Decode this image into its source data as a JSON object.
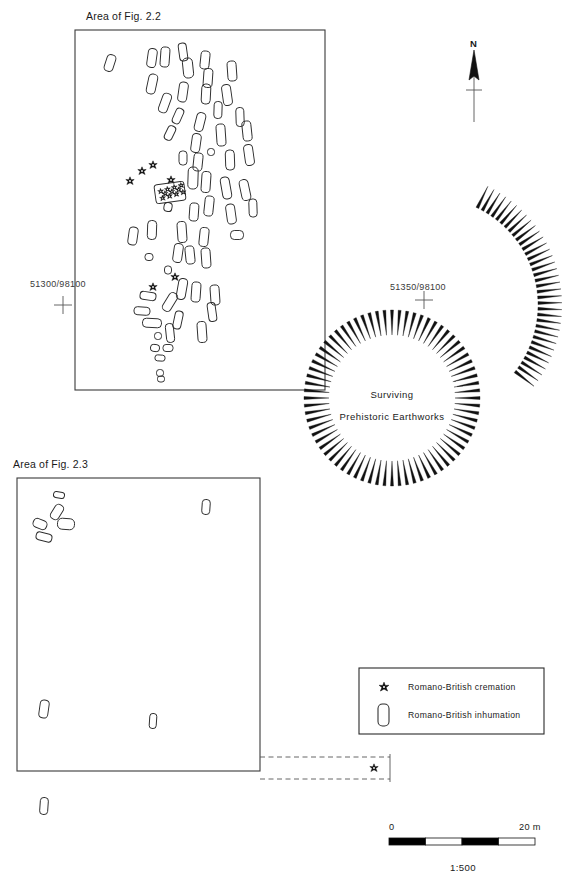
{
  "figure": {
    "type": "archaeological-site-plan",
    "background_color": "#ffffff",
    "ink_color": "#1a1a1a"
  },
  "area_labels": {
    "fig22": "Area of Fig. 2.2",
    "fig23": "Area of Fig. 2.3"
  },
  "grid_coordinates": [
    {
      "label": "51300/98100",
      "x": 63,
      "y": 305
    },
    {
      "label": "51350/98100",
      "x": 424,
      "y": 300
    }
  ],
  "earthworks": {
    "line1": "Surviving",
    "line2": "Prehistoric Earthworks"
  },
  "north_arrow": {
    "label": "N"
  },
  "legend": {
    "items": [
      {
        "symbol": "cremation-star-icon",
        "label": "Romano-British cremation"
      },
      {
        "symbol": "inhumation-grave-icon",
        "label": "Romano-British inhumation"
      }
    ]
  },
  "scale_bar": {
    "start_label": "0",
    "end_label": "20 m",
    "ratio": "1:500",
    "segments": 4,
    "segment_colors": [
      "#000000",
      "#ffffff",
      "#000000",
      "#ffffff"
    ]
  },
  "map_geometry": {
    "area_fig22_box": {
      "x": 75,
      "y": 30,
      "w": 250,
      "h": 360
    },
    "area_fig23_box": {
      "x": 17,
      "y": 478,
      "w": 243,
      "h": 293
    },
    "dashed_corridor": {
      "x": 260,
      "y": 757,
      "w": 130,
      "h": 22
    },
    "earthwork_circle": {
      "cx": 392,
      "cy": 398,
      "r_inner": 63,
      "r_outer": 88,
      "hachures": 72
    },
    "earthwork_arc": {
      "cx": 430,
      "cy": 305,
      "r_inner": 108,
      "r_outer": 132,
      "start_deg": -64,
      "end_deg": 38,
      "hachures": 34
    }
  },
  "inhumations_fig22": [
    {
      "x": 110,
      "y": 63,
      "w": 9,
      "h": 17,
      "a": 18
    },
    {
      "x": 152,
      "y": 58,
      "w": 9,
      "h": 19,
      "a": 8
    },
    {
      "x": 165,
      "y": 57,
      "w": 9,
      "h": 20,
      "a": 4
    },
    {
      "x": 183,
      "y": 52,
      "w": 8,
      "h": 18,
      "a": 172
    },
    {
      "x": 188,
      "y": 68,
      "w": 10,
      "h": 20,
      "a": 174
    },
    {
      "x": 205,
      "y": 60,
      "w": 9,
      "h": 18,
      "a": 6
    },
    {
      "x": 208,
      "y": 78,
      "w": 9,
      "h": 19,
      "a": 4
    },
    {
      "x": 152,
      "y": 84,
      "w": 9,
      "h": 20,
      "a": 12
    },
    {
      "x": 183,
      "y": 92,
      "w": 9,
      "h": 20,
      "a": 8
    },
    {
      "x": 206,
      "y": 94,
      "w": 9,
      "h": 20,
      "a": 3
    },
    {
      "x": 165,
      "y": 103,
      "w": 9,
      "h": 20,
      "a": 20
    },
    {
      "x": 232,
      "y": 71,
      "w": 9,
      "h": 20,
      "a": 176
    },
    {
      "x": 227,
      "y": 95,
      "w": 9,
      "h": 21,
      "a": 172
    },
    {
      "x": 200,
      "y": 122,
      "w": 9,
      "h": 19,
      "a": 14
    },
    {
      "x": 178,
      "y": 116,
      "w": 8,
      "h": 16,
      "a": 24
    },
    {
      "x": 218,
      "y": 110,
      "w": 8,
      "h": 17,
      "a": 2
    },
    {
      "x": 240,
      "y": 117,
      "w": 8,
      "h": 19,
      "a": 178
    },
    {
      "x": 170,
      "y": 133,
      "w": 8,
      "h": 15,
      "a": 26
    },
    {
      "x": 196,
      "y": 143,
      "w": 9,
      "h": 19,
      "a": 8
    },
    {
      "x": 221,
      "y": 135,
      "w": 9,
      "h": 22,
      "a": 176
    },
    {
      "x": 247,
      "y": 131,
      "w": 9,
      "h": 20,
      "a": 174
    },
    {
      "x": 211,
      "y": 152,
      "w": 7,
      "h": 7,
      "a": 0
    },
    {
      "x": 198,
      "y": 162,
      "w": 9,
      "h": 18,
      "a": 6
    },
    {
      "x": 183,
      "y": 158,
      "w": 8,
      "h": 14,
      "a": 0
    },
    {
      "x": 230,
      "y": 160,
      "w": 9,
      "h": 20,
      "a": 178
    },
    {
      "x": 249,
      "y": 155,
      "w": 9,
      "h": 21,
      "a": 172
    },
    {
      "x": 206,
      "y": 182,
      "w": 9,
      "h": 21,
      "a": 4
    },
    {
      "x": 193,
      "y": 178,
      "w": 10,
      "h": 22,
      "a": 2
    },
    {
      "x": 226,
      "y": 188,
      "w": 9,
      "h": 22,
      "a": 170
    },
    {
      "x": 245,
      "y": 190,
      "w": 9,
      "h": 21,
      "a": 168
    },
    {
      "x": 209,
      "y": 206,
      "w": 9,
      "h": 20,
      "a": 6
    },
    {
      "x": 194,
      "y": 212,
      "w": 9,
      "h": 18,
      "a": 4
    },
    {
      "x": 231,
      "y": 214,
      "w": 9,
      "h": 20,
      "a": 172
    },
    {
      "x": 253,
      "y": 208,
      "w": 8,
      "h": 18,
      "a": 178
    },
    {
      "x": 168,
      "y": 207,
      "w": 8,
      "h": 9,
      "a": 10
    },
    {
      "x": 133,
      "y": 236,
      "w": 9,
      "h": 18,
      "a": 8
    },
    {
      "x": 152,
      "y": 230,
      "w": 9,
      "h": 19,
      "a": 2
    },
    {
      "x": 182,
      "y": 232,
      "w": 9,
      "h": 21,
      "a": 176
    },
    {
      "x": 204,
      "y": 237,
      "w": 9,
      "h": 19,
      "a": 6
    },
    {
      "x": 237,
      "y": 235,
      "w": 13,
      "h": 9,
      "a": 0
    },
    {
      "x": 149,
      "y": 257,
      "w": 8,
      "h": 7,
      "a": 0
    },
    {
      "x": 178,
      "y": 253,
      "w": 9,
      "h": 19,
      "a": 8
    },
    {
      "x": 190,
      "y": 255,
      "w": 9,
      "h": 18,
      "a": 174
    },
    {
      "x": 206,
      "y": 258,
      "w": 9,
      "h": 20,
      "a": 176
    },
    {
      "x": 168,
      "y": 270,
      "w": 7,
      "h": 8,
      "a": 0
    },
    {
      "x": 148,
      "y": 296,
      "w": 16,
      "h": 8,
      "a": 8
    },
    {
      "x": 182,
      "y": 289,
      "w": 9,
      "h": 21,
      "a": 10
    },
    {
      "x": 196,
      "y": 292,
      "w": 9,
      "h": 20,
      "a": 4
    },
    {
      "x": 215,
      "y": 295,
      "w": 9,
      "h": 20,
      "a": 176
    },
    {
      "x": 142,
      "y": 311,
      "w": 16,
      "h": 8,
      "a": 4
    },
    {
      "x": 170,
      "y": 302,
      "w": 9,
      "h": 20,
      "a": 32
    },
    {
      "x": 212,
      "y": 312,
      "w": 8,
      "h": 19,
      "a": 172
    },
    {
      "x": 152,
      "y": 323,
      "w": 19,
      "h": 9,
      "a": 3
    },
    {
      "x": 178,
      "y": 320,
      "w": 8,
      "h": 18,
      "a": 12
    },
    {
      "x": 158,
      "y": 336,
      "w": 7,
      "h": 7,
      "a": 0
    },
    {
      "x": 170,
      "y": 333,
      "w": 8,
      "h": 19,
      "a": 174
    },
    {
      "x": 202,
      "y": 332,
      "w": 9,
      "h": 21,
      "a": 176
    },
    {
      "x": 155,
      "y": 348,
      "w": 9,
      "h": 7,
      "a": 6
    },
    {
      "x": 168,
      "y": 348,
      "w": 10,
      "h": 7,
      "a": 0
    },
    {
      "x": 160,
      "y": 358,
      "w": 10,
      "h": 6,
      "a": 4
    },
    {
      "x": 160,
      "y": 373,
      "w": 7,
      "h": 7,
      "a": 0
    },
    {
      "x": 161,
      "y": 379,
      "w": 7,
      "h": 6,
      "a": 0
    }
  ],
  "cremations_fig22": [
    {
      "x": 130,
      "y": 181
    },
    {
      "x": 142,
      "y": 171
    },
    {
      "x": 153,
      "y": 165
    },
    {
      "x": 171,
      "y": 180
    },
    {
      "x": 175,
      "y": 277
    },
    {
      "x": 153,
      "y": 287
    }
  ],
  "cremation_cluster": {
    "box": {
      "x": 155,
      "y": 183,
      "w": 30,
      "h": 19,
      "a": -8
    },
    "stars": [
      {
        "x": 161,
        "y": 190
      },
      {
        "x": 168,
        "y": 189
      },
      {
        "x": 175,
        "y": 188
      },
      {
        "x": 182,
        "y": 187
      },
      {
        "x": 162,
        "y": 197
      },
      {
        "x": 169,
        "y": 196
      },
      {
        "x": 176,
        "y": 195
      },
      {
        "x": 183,
        "y": 194
      },
      {
        "x": 165,
        "y": 193
      },
      {
        "x": 172,
        "y": 192
      },
      {
        "x": 179,
        "y": 191
      }
    ]
  },
  "inhumations_fig23": [
    {
      "x": 59,
      "y": 495,
      "w": 11,
      "h": 6,
      "a": 10
    },
    {
      "x": 57,
      "y": 512,
      "w": 9,
      "h": 16,
      "a": 32
    },
    {
      "x": 40,
      "y": 524,
      "w": 14,
      "h": 9,
      "a": 22
    },
    {
      "x": 66,
      "y": 524,
      "w": 17,
      "h": 11,
      "a": 4
    },
    {
      "x": 44,
      "y": 537,
      "w": 16,
      "h": 8,
      "a": 14
    },
    {
      "x": 206,
      "y": 507,
      "w": 8,
      "h": 15,
      "a": 4
    },
    {
      "x": 44,
      "y": 709,
      "w": 9,
      "h": 18,
      "a": 8
    },
    {
      "x": 153,
      "y": 721,
      "w": 7,
      "h": 15,
      "a": 4
    },
    {
      "x": 44,
      "y": 806,
      "w": 8,
      "h": 17,
      "a": 4
    }
  ],
  "cremations_corridor": [
    {
      "x": 374,
      "y": 768
    }
  ]
}
